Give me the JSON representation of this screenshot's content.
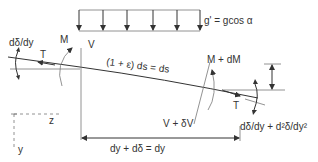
{
  "figure": {
    "type": "free-body diagram of a beam element under axial tension with distributed load",
    "load_label": "g' = gcos α",
    "labels": {
      "left_slope": "dδ/dy",
      "left_tension": "T",
      "left_moment": "M",
      "left_shear": "V",
      "arc_length": "(1 + ε) ds = ds",
      "right_moment": "M + dM",
      "right_shear": "V + δV",
      "right_tension": "T",
      "right_slope": "dδ/dy + d²δ/dy²",
      "horizontal_dimension": "dy + dδ = dy",
      "axis_z": "z",
      "axis_y": "y"
    },
    "load_arrows_count": 6,
    "colors": {
      "line": "#333333",
      "secondary_line": "#777777",
      "background": "#ffffff"
    }
  }
}
